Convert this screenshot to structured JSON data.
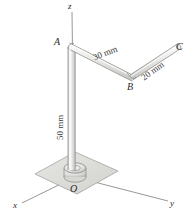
{
  "figure": {
    "background_color": "#ffffff",
    "rod_fill_color": "#e3e3e1",
    "rod_highlight_color": "#fbfbfb",
    "rod_stroke_color": "#8a8a8a",
    "plate_fill_color": "#dededa",
    "plate_stroke_color": "#9a9a9a",
    "axis_color": "#7d7d7d",
    "label_color": "#2b2b2b"
  },
  "points": {
    "A": "A",
    "B": "B",
    "C": "C",
    "O": "O"
  },
  "axes": {
    "x": "x",
    "y": "y",
    "z": "z"
  },
  "dimensions": {
    "ab": "30 mm",
    "bc": "20 mm",
    "oa": "50 mm"
  },
  "geometry": {
    "O": [
      75,
      176
    ],
    "A": [
      71,
      46
    ],
    "B": [
      131,
      78
    ],
    "C": [
      178,
      47
    ],
    "x_axis_end": [
      22,
      203
    ],
    "y_axis_end": [
      168,
      201
    ],
    "z_axis_top": [
      72,
      12
    ],
    "rod_radius_px": 3.2
  }
}
